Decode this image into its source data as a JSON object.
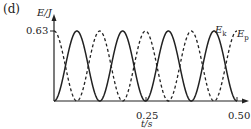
{
  "panel_label": "(d)",
  "chart_data": {
    "type": "line",
    "title": "",
    "xlabel": "t/s",
    "ylabel": "E/J",
    "xlim": [
      0,
      0.5
    ],
    "ylim": [
      0,
      0.63
    ],
    "x_ticks": [
      "0.25",
      "0.50"
    ],
    "y_ticks": [
      "0.63"
    ],
    "grid": false,
    "series": [
      {
        "name": "E_k",
        "style": "solid",
        "formula": "0.63*sin^2(8*pi*t)",
        "x": [
          0,
          0.0625,
          0.125,
          0.1875,
          0.25,
          0.3125,
          0.375,
          0.4375,
          0.5
        ],
        "values": [
          0,
          0.63,
          0,
          0.63,
          0,
          0.63,
          0,
          0.63,
          0
        ]
      },
      {
        "name": "E_p",
        "style": "dashed",
        "formula": "0.63*cos^2(8*pi*t)",
        "x": [
          0,
          0.0625,
          0.125,
          0.1875,
          0.25,
          0.3125,
          0.375,
          0.4375,
          0.5
        ],
        "values": [
          0.63,
          0,
          0.63,
          0,
          0.63,
          0,
          0.63,
          0,
          0.63
        ]
      }
    ],
    "legend": "inline labels at right end of curves"
  },
  "labels": {
    "y_axis": "E/J",
    "x_axis": "t/s",
    "y_tick": "0.63",
    "x_tick_1": "0.25",
    "x_tick_2": "0.50",
    "ek_main": "E",
    "ek_sub": "k",
    "ep_main": "E",
    "ep_sub": "p"
  }
}
